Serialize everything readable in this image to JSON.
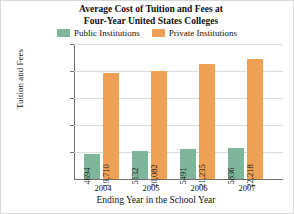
{
  "chart_data": {
    "type": "bar",
    "title": "Average Cost of Tuition and Fees at Four-Year United States Colleges",
    "title_lines": [
      "Average Cost of Tuition and Fees at",
      "Four-Year United States Colleges"
    ],
    "xlabel": "Ending Year in the School Year",
    "ylabel": "Tuition and Fees",
    "categories": [
      "2004",
      "2005",
      "2006",
      "2007"
    ],
    "series": [
      {
        "name": "Public Institutions",
        "color": "#7FB69B",
        "values": [
          4694,
          5132,
          5491,
          5836
        ],
        "value_labels": [
          "4694",
          "5132",
          "5491",
          "5836"
        ]
      },
      {
        "name": "Private Institutions",
        "color": "#F0A055",
        "values": [
          19710,
          20082,
          21235,
          22218
        ],
        "value_labels": [
          "19,710",
          "20,082",
          "21,235",
          "22,218"
        ]
      }
    ],
    "ylim": [
      0,
      25000
    ],
    "ytick_values": [
      5000,
      10000,
      15000,
      20000,
      25000
    ],
    "ytick_labels": [
      "$5,000",
      "$10,000",
      "$15,000",
      "$20,000",
      "$25,000"
    ],
    "grid": true,
    "legend_position": "top"
  }
}
